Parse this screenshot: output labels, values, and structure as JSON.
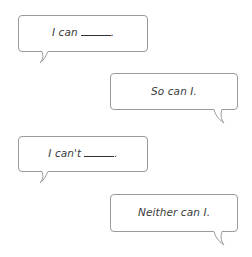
{
  "bubbles": [
    {
      "id": "b1",
      "text": "I can",
      "has_blank": true,
      "suffix": ".",
      "tail": "left"
    },
    {
      "id": "b2",
      "text": "So can I.",
      "has_blank": false,
      "tail": "right"
    },
    {
      "id": "b3",
      "text": "I can't",
      "has_blank": true,
      "suffix": ".",
      "tail": "left"
    },
    {
      "id": "b4",
      "text": "Neither can I.",
      "has_blank": false,
      "tail": "right"
    }
  ],
  "colors": {
    "border": "#9a9a9a",
    "text": "#3a3a3a"
  }
}
